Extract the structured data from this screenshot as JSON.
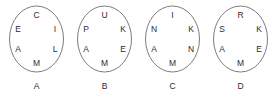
{
  "figure": {
    "type": "lettered-circles-puzzle",
    "stroke_color": "#5a5a5a",
    "text_color": "#2b2b2b",
    "background_color": "#ffffff",
    "circles": [
      {
        "label": "A",
        "letters": {
          "top": "C",
          "upper_right": "I",
          "lower_right": "L",
          "bottom": "M",
          "lower_left": "A",
          "upper_left": "E"
        }
      },
      {
        "label": "B",
        "letters": {
          "top": "U",
          "upper_right": "K",
          "lower_right": "E",
          "bottom": "M",
          "lower_left": "A",
          "upper_left": "P"
        }
      },
      {
        "label": "C",
        "letters": {
          "top": "I",
          "upper_right": "K",
          "lower_right": "N",
          "bottom": "M",
          "lower_left": "A",
          "upper_left": "N"
        }
      },
      {
        "label": "D",
        "letters": {
          "top": "R",
          "upper_right": "K",
          "lower_right": "E",
          "bottom": "M",
          "lower_left": "A",
          "upper_left": "S"
        }
      }
    ]
  }
}
